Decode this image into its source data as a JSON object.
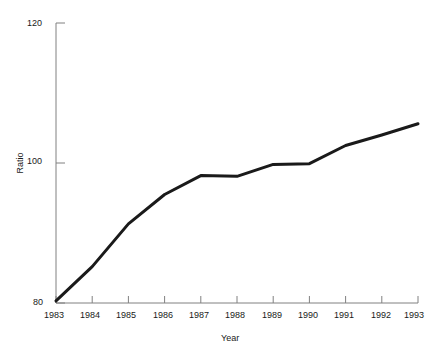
{
  "chart_data": {
    "type": "line",
    "title": "",
    "xlabel": "Year",
    "ylabel": "Ratio",
    "x": [
      1983,
      1984,
      1985,
      1986,
      1987,
      1988,
      1989,
      1990,
      1991,
      1992,
      1993
    ],
    "values": [
      80.3,
      85.2,
      91.3,
      95.5,
      98.2,
      98.1,
      99.8,
      99.9,
      102.5,
      104.0,
      105.6
    ],
    "series": [
      {
        "name": "Ratio",
        "values": [
          80.3,
          85.2,
          91.3,
          95.5,
          98.2,
          98.1,
          99.8,
          99.9,
          102.5,
          104.0,
          105.6
        ]
      }
    ],
    "categories": [
      "1983",
      "1984",
      "1985",
      "1986",
      "1987",
      "1988",
      "1989",
      "1990",
      "1991",
      "1992",
      "1993"
    ],
    "xlim": [
      1983,
      1993
    ],
    "ylim": [
      80,
      120
    ],
    "yticks": [
      80,
      100,
      120
    ],
    "ytick_labels": [
      "80",
      "100",
      "120"
    ],
    "xticks": [
      1983,
      1984,
      1985,
      1986,
      1987,
      1988,
      1989,
      1990,
      1991,
      1992,
      1993
    ],
    "xtick_labels": [
      "1983",
      "1984",
      "1985",
      "1986",
      "1987",
      "1988",
      "1989",
      "1990",
      "1991",
      "1992",
      "1993"
    ],
    "grid": false,
    "legend": null,
    "legend_position": "none",
    "line_color": "#1a1a1a",
    "line_width": 3,
    "axis_color": "#808080",
    "background_color": "#ffffff"
  },
  "axes": {
    "y_tick_120": "120",
    "y_tick_100": "100",
    "y_tick_80": "80",
    "y_axis_title": "Ratio",
    "x_axis_title": "Year",
    "x_tick_1983": "1983",
    "x_tick_1984": "1984",
    "x_tick_1985": "1985",
    "x_tick_1986": "1986",
    "x_tick_1987": "1987",
    "x_tick_1988": "1988",
    "x_tick_1989": "1989",
    "x_tick_1990": "1990",
    "x_tick_1991": "1991",
    "x_tick_1992": "1992",
    "x_tick_1993": "1993"
  }
}
